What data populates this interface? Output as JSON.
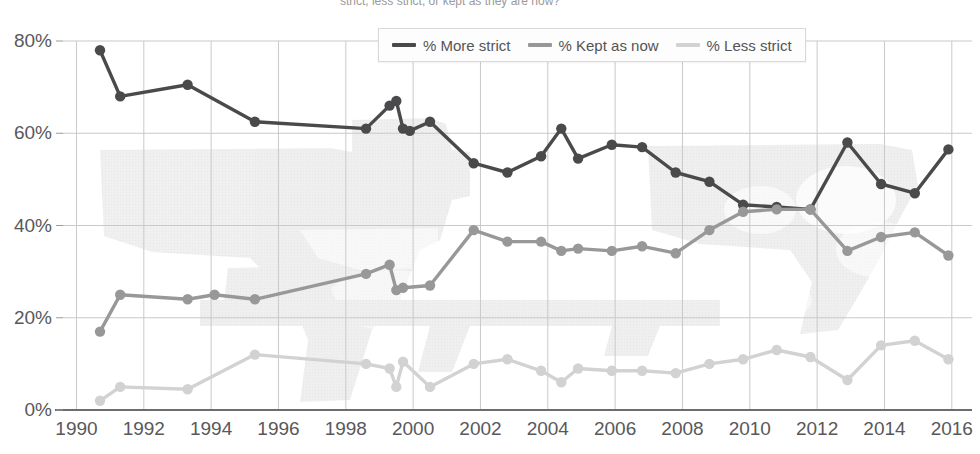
{
  "chart_data": {
    "type": "line",
    "title_visible_fragment": "strict, less strict, or kept as they are now?",
    "xlabel": "",
    "ylabel": "",
    "xlim": [
      1989.6,
      2016.6
    ],
    "ylim": [
      0,
      80
    ],
    "grid": true,
    "legend_position": "top-center",
    "y_ticks": [
      "0%",
      "20%",
      "40%",
      "60%",
      "80%"
    ],
    "y_tick_values": [
      0,
      20,
      40,
      60,
      80
    ],
    "x_ticks": [
      "1990",
      "1992",
      "1994",
      "1996",
      "1998",
      "2000",
      "2002",
      "2004",
      "2006",
      "2008",
      "2010",
      "2012",
      "2014",
      "2016"
    ],
    "x_tick_values": [
      1990,
      1992,
      1994,
      1996,
      1998,
      2000,
      2002,
      2004,
      2006,
      2008,
      2010,
      2012,
      2014,
      2016
    ],
    "series": [
      {
        "name": "% More strict",
        "color": "#4a4a4c",
        "points": [
          {
            "x": 1990.7,
            "y": 78
          },
          {
            "x": 1991.3,
            "y": 68
          },
          {
            "x": 1993.3,
            "y": 70.5
          },
          {
            "x": 1995.3,
            "y": 62.5
          },
          {
            "x": 1998.6,
            "y": 61
          },
          {
            "x": 1999.3,
            "y": 66
          },
          {
            "x": 1999.5,
            "y": 67
          },
          {
            "x": 1999.7,
            "y": 61
          },
          {
            "x": 1999.9,
            "y": 60.5
          },
          {
            "x": 2000.5,
            "y": 62.5
          },
          {
            "x": 2001.8,
            "y": 53.5
          },
          {
            "x": 2002.8,
            "y": 51.5
          },
          {
            "x": 2003.8,
            "y": 55
          },
          {
            "x": 2004.4,
            "y": 61
          },
          {
            "x": 2004.9,
            "y": 54.5
          },
          {
            "x": 2005.9,
            "y": 57.5
          },
          {
            "x": 2006.8,
            "y": 57
          },
          {
            "x": 2007.8,
            "y": 51.5
          },
          {
            "x": 2008.8,
            "y": 49.5
          },
          {
            "x": 2009.8,
            "y": 44.5
          },
          {
            "x": 2010.8,
            "y": 44
          },
          {
            "x": 2011.8,
            "y": 43.5
          },
          {
            "x": 2012.9,
            "y": 58
          },
          {
            "x": 2013.9,
            "y": 49
          },
          {
            "x": 2014.9,
            "y": 47
          },
          {
            "x": 2015.9,
            "y": 56.5
          }
        ]
      },
      {
        "name": "% Kept as now",
        "color": "#989898",
        "points": [
          {
            "x": 1990.7,
            "y": 17
          },
          {
            "x": 1991.3,
            "y": 25
          },
          {
            "x": 1993.3,
            "y": 24
          },
          {
            "x": 1994.1,
            "y": 25
          },
          {
            "x": 1995.3,
            "y": 24
          },
          {
            "x": 1998.6,
            "y": 29.5
          },
          {
            "x": 1999.3,
            "y": 31.5
          },
          {
            "x": 1999.5,
            "y": 26
          },
          {
            "x": 1999.7,
            "y": 26.5
          },
          {
            "x": 2000.5,
            "y": 27
          },
          {
            "x": 2001.8,
            "y": 39
          },
          {
            "x": 2002.8,
            "y": 36.5
          },
          {
            "x": 2003.8,
            "y": 36.5
          },
          {
            "x": 2004.4,
            "y": 34.5
          },
          {
            "x": 2004.9,
            "y": 35
          },
          {
            "x": 2005.9,
            "y": 34.5
          },
          {
            "x": 2006.8,
            "y": 35.5
          },
          {
            "x": 2007.8,
            "y": 34
          },
          {
            "x": 2008.8,
            "y": 39
          },
          {
            "x": 2009.8,
            "y": 43
          },
          {
            "x": 2010.8,
            "y": 43.5
          },
          {
            "x": 2011.8,
            "y": 43.5
          },
          {
            "x": 2012.9,
            "y": 34.5
          },
          {
            "x": 2013.9,
            "y": 37.5
          },
          {
            "x": 2014.9,
            "y": 38.5
          },
          {
            "x": 2015.9,
            "y": 33.5
          }
        ]
      },
      {
        "name": "% Less strict",
        "color": "#d2d2d2",
        "points": [
          {
            "x": 1990.7,
            "y": 2
          },
          {
            "x": 1991.3,
            "y": 5
          },
          {
            "x": 1993.3,
            "y": 4.5
          },
          {
            "x": 1995.3,
            "y": 12
          },
          {
            "x": 1998.6,
            "y": 10
          },
          {
            "x": 1999.3,
            "y": 9
          },
          {
            "x": 1999.5,
            "y": 5
          },
          {
            "x": 1999.7,
            "y": 10.5
          },
          {
            "x": 2000.5,
            "y": 5
          },
          {
            "x": 2001.8,
            "y": 10
          },
          {
            "x": 2002.8,
            "y": 11
          },
          {
            "x": 2003.8,
            "y": 8.5
          },
          {
            "x": 2004.4,
            "y": 6
          },
          {
            "x": 2004.9,
            "y": 9
          },
          {
            "x": 2005.9,
            "y": 8.5
          },
          {
            "x": 2006.8,
            "y": 8.5
          },
          {
            "x": 2007.8,
            "y": 8
          },
          {
            "x": 2008.8,
            "y": 10
          },
          {
            "x": 2009.8,
            "y": 11
          },
          {
            "x": 2010.8,
            "y": 13
          },
          {
            "x": 2011.8,
            "y": 11.5
          },
          {
            "x": 2012.9,
            "y": 6.5
          },
          {
            "x": 2013.9,
            "y": 14
          },
          {
            "x": 2014.9,
            "y": 15
          },
          {
            "x": 2015.9,
            "y": 11
          }
        ]
      }
    ]
  },
  "legend": {
    "items": [
      {
        "label": "% More strict",
        "color": "#4a4a4c"
      },
      {
        "label": "% Kept as now",
        "color": "#989898"
      },
      {
        "label": "% Less strict",
        "color": "#d2d2d2"
      }
    ]
  },
  "watermark": {
    "description": "faint light-gray handgun and rifle silhouettes behind the plot",
    "color": "#ececec"
  }
}
